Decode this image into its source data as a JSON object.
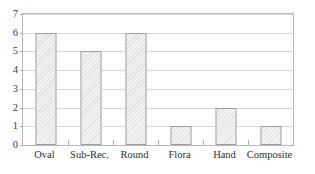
{
  "chart_data": {
    "type": "bar",
    "title": "",
    "subtitle": "",
    "xlabel": "",
    "ylabel": "",
    "categories": [
      "Oval",
      "Sub-Rec.",
      "Round",
      "Flora",
      "Hand",
      "Composite"
    ],
    "values": [
      6,
      5,
      6,
      1,
      2,
      1
    ],
    "ylim": [
      0,
      7
    ],
    "ytick_labels": [
      "0",
      "1",
      "2",
      "3",
      "4",
      "5",
      "6",
      "7"
    ],
    "ytick_values": [
      0,
      1,
      2,
      3,
      4,
      5,
      6,
      7
    ],
    "grid": true,
    "grid_axis": "y",
    "legend": false,
    "legend_position": "none",
    "series": [
      {
        "name": "count",
        "values": [
          6,
          5,
          6,
          1,
          2,
          1
        ]
      }
    ],
    "colors": {
      "bar_fill": "#f2f2f2",
      "bar_edge": "#9e9e9e",
      "gridline": "#d8d8d8",
      "frame": "#b9b9b9",
      "text": "#3a3a3a"
    }
  }
}
